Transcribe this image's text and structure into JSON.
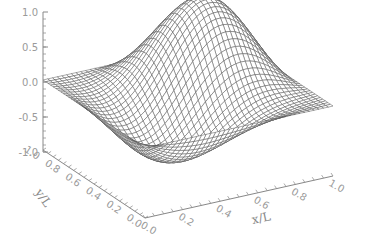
{
  "chart_data": {
    "type": "surface",
    "title": "",
    "xlabel": "x/L",
    "ylabel": "y/L",
    "zlabel": "",
    "x_ticks": [
      "0.0",
      "0.2",
      "0.4",
      "0.6",
      "0.8",
      "1.0"
    ],
    "y_ticks": [
      "0.0",
      "0.2",
      "0.4",
      "0.6",
      "0.8",
      "1.0"
    ],
    "z_ticks": [
      "-1.0",
      "-0.5",
      "0.0",
      "0.5",
      "1.0"
    ],
    "xlim": [
      0,
      1
    ],
    "ylim": [
      0,
      1
    ],
    "zlim": [
      -1,
      1
    ],
    "grid_resolution": 40,
    "surface_description": "wireframe mesh of a two-dimensional wave mode; zero along corners x=0,y=1 and x=1,y=0; peak near (0.75,0.75) approx z=0.9; troughs along front and left edges approx z=-0.6",
    "line_color": "#555555",
    "axis_color": "#888888"
  }
}
